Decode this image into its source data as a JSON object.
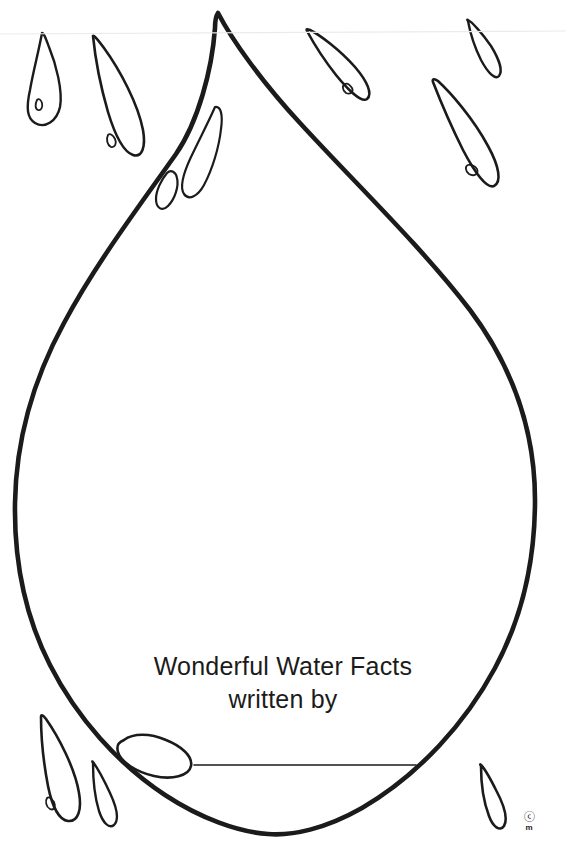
{
  "page": {
    "kind": "printable-worksheet",
    "background_color": "#ffffff",
    "ink_color": "#1b1b1b",
    "width": 566,
    "height": 847
  },
  "title": {
    "line1": "Wonderful Water Facts",
    "line2": "written by"
  },
  "signature": {
    "line_label": "",
    "line_color": "#1b1b1b"
  },
  "credit": {
    "mark": "ⓒ",
    "initials": "m"
  },
  "artwork": {
    "main_drop_name": "large-water-drop-outline",
    "small_drops_count": 9,
    "highlights_count": 3
  }
}
